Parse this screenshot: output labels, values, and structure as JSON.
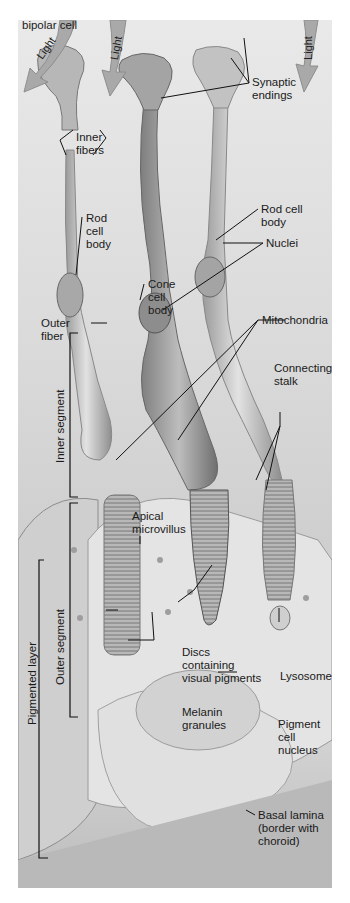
{
  "figure": {
    "light_arrows": [
      {
        "label": "Light"
      },
      {
        "label": "Light"
      },
      {
        "label": "Light"
      }
    ],
    "labels": {
      "process_bipolar": "Process of\nbipolar cell",
      "synaptic_endings": "Synaptic\nendings",
      "inner_fibers": "Inner\nfibers",
      "rod_cell_body_left": "Rod\ncell\nbody",
      "rod_cell_body_right": "Rod cell\nbody",
      "nuclei": "Nuclei",
      "cone_cell_body": "Cone\ncell\nbody",
      "outer_fiber": "Outer\nfiber",
      "mitochondria": "Mitochondria",
      "connecting_stalk": "Connecting\nstalk",
      "apical_microvillus": "Apical\nmicrovillus",
      "discs": "Discs\ncontaining\nvisual pigments",
      "melanin_granules": "Melanin\ngranules",
      "lysosome": "Lysosome",
      "pigment_cell_nucleus": "Pigment\ncell\nnucleus",
      "basal_lamina": "Basal lamina\n(border with\nchoroid)"
    },
    "brackets": {
      "inner_segment": "Inner segment",
      "outer_segment": "Outer segment",
      "pigmented_layer": "Pigmented layer"
    },
    "colors": {
      "background": "#dcdcdc",
      "arrow_fill": "#a9a9a9",
      "cell_fill": "#c4c4c4",
      "cell_edge": "#8a8a8a",
      "leader_line": "#111111"
    }
  }
}
